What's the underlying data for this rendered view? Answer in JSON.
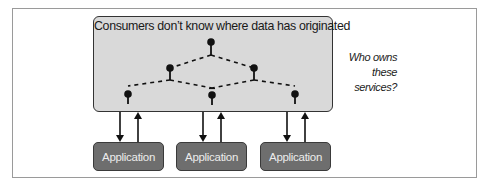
{
  "diagram": {
    "platform": {
      "title": "Consumers don’t know where data has originated",
      "fill": "#d9d9d9"
    },
    "question": {
      "line1": "Who owns",
      "line2": "these services?"
    },
    "applications": [
      {
        "label": "Application"
      },
      {
        "label": "Application"
      },
      {
        "label": "Application"
      }
    ],
    "nodes": [
      {
        "id": "top",
        "x": 211,
        "y": 42
      },
      {
        "id": "mid-left",
        "x": 170,
        "y": 68
      },
      {
        "id": "mid-right",
        "x": 254,
        "y": 68
      },
      {
        "id": "bottom-left",
        "x": 128,
        "y": 94
      },
      {
        "id": "bottom-middle",
        "x": 212,
        "y": 95
      },
      {
        "id": "bottom-right",
        "x": 295,
        "y": 94
      }
    ],
    "colors": {
      "application_fill": "#6e6e6e",
      "application_text": "#ececec",
      "line": "#111111"
    }
  }
}
